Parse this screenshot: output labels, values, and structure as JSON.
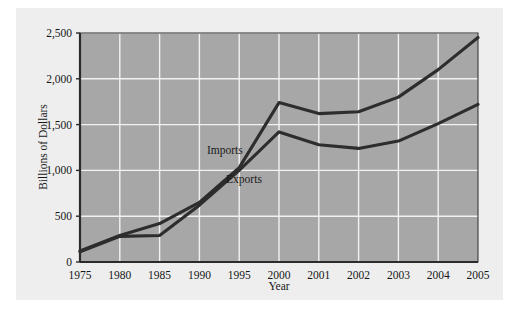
{
  "chart_data": {
    "type": "line",
    "title": "",
    "xlabel": "Year",
    "ylabel": "Billions of Dollars",
    "x": [
      1975,
      1980,
      1985,
      1990,
      1995,
      2000,
      2001,
      2002,
      2003,
      2004,
      2005
    ],
    "categories": [
      "1975",
      "1980",
      "1985",
      "1990",
      "1995",
      "2000",
      "2001",
      "2002",
      "2003",
      "2004",
      "2005"
    ],
    "xtick_labels": [
      "1975",
      "1980",
      "1985",
      "1990",
      "1995",
      "2000",
      "2001",
      "2002",
      "2003",
      "2004",
      "2005"
    ],
    "ytick_labels": [
      "0",
      "500",
      "1,000",
      "1,500",
      "2,000",
      "2,500"
    ],
    "ytick_values": [
      0,
      500,
      1000,
      1500,
      2000,
      2500
    ],
    "ylim": [
      0,
      2500
    ],
    "grid": true,
    "legend_position": "inline-annotations",
    "series": [
      {
        "name": "Imports",
        "label": "Imports",
        "color": "#2d2d2d",
        "values": [
          120,
          290,
          420,
          650,
          1030,
          1740,
          1620,
          1640,
          1800,
          2100,
          2450
        ]
      },
      {
        "name": "Exports",
        "label": "Exports",
        "color": "#2d2d2d",
        "values": [
          110,
          280,
          290,
          620,
          1000,
          1420,
          1280,
          1240,
          1320,
          1510,
          1720
        ]
      }
    ],
    "annotations": [
      {
        "text": "Imports",
        "x": 1993.2,
        "y": 1180
      },
      {
        "text": "Exports",
        "x": 1995.6,
        "y": 860
      }
    ],
    "colors": {
      "plot_background": "#a7a7a7",
      "gridline": "#f2f2f2",
      "line": "#2d2d2d",
      "axis": "#2b2b2b",
      "card_background": "#eeeeee",
      "page_background": "#ffffff",
      "text": "#171717"
    }
  }
}
